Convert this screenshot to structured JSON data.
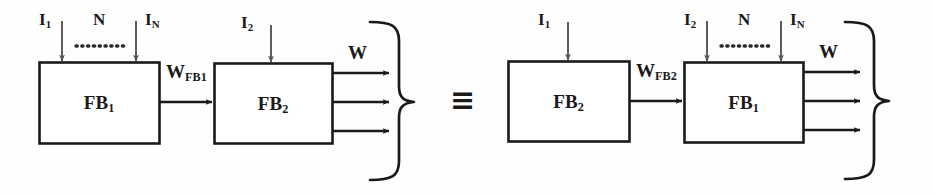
{
  "figure": {
    "type": "block-diagram",
    "relation_symbol": "≡",
    "background_color": "#fefefe",
    "stroke_color": "#1a1a1a",
    "text_color": "#1a1a1a"
  },
  "left_side": {
    "block1": {
      "label_main": "FB",
      "label_sub": "1",
      "inputs": [
        {
          "main": "I",
          "sub": "1"
        },
        {
          "main": "I",
          "sub": "N"
        }
      ],
      "input_count_label": "N",
      "ellipsis": "··········"
    },
    "interconnect": {
      "main": "W",
      "sub": "FB1"
    },
    "block2": {
      "label_main": "FB",
      "label_sub": "2",
      "inputs": [
        {
          "main": "I",
          "sub": "2"
        }
      ]
    },
    "output": {
      "main": "W",
      "sub": ""
    },
    "output_arrow_count": 3
  },
  "right_side": {
    "block1": {
      "label_main": "FB",
      "label_sub": "2",
      "inputs": [
        {
          "main": "I",
          "sub": "1"
        }
      ]
    },
    "interconnect": {
      "main": "W",
      "sub": "FB2"
    },
    "block2": {
      "label_main": "FB",
      "label_sub": "1",
      "inputs": [
        {
          "main": "I",
          "sub": "2"
        },
        {
          "main": "I",
          "sub": "N"
        }
      ],
      "input_count_label": "N",
      "ellipsis": "··········"
    },
    "output": {
      "main": "W",
      "sub": ""
    },
    "output_arrow_count": 3
  }
}
